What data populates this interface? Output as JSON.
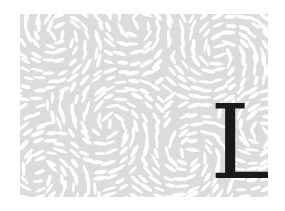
{
  "drop_cap": {
    "letter": "L",
    "color": "#1a1a1a"
  },
  "pattern": {
    "name": "petal-swirl-pattern",
    "background": "#dcdcdc",
    "petal_color": "#ffffff"
  }
}
